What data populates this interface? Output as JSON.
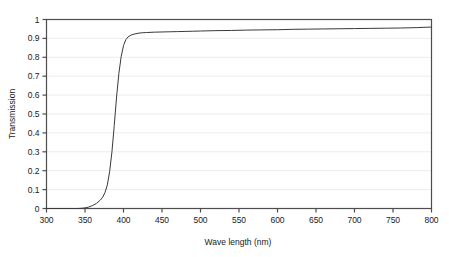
{
  "chart_data": {
    "type": "line",
    "title": "",
    "xlabel": "Wave length (nm)",
    "ylabel": "Transmission",
    "xlim": [
      300,
      800
    ],
    "ylim": [
      0,
      1
    ],
    "grid": true,
    "legend": "none",
    "xticks": [
      "300",
      "350",
      "400",
      "450",
      "500",
      "550",
      "600",
      "650",
      "700",
      "750",
      "800"
    ],
    "xtick_values": [
      300,
      350,
      400,
      450,
      500,
      550,
      600,
      650,
      700,
      750,
      800
    ],
    "yticks": [
      "0",
      "0.1",
      "0.2",
      "0.3",
      "0.4",
      "0.5",
      "0.6",
      "0.7",
      "0.8",
      "0.9",
      "1"
    ],
    "ytick_values": [
      0,
      0.1,
      0.2,
      0.3,
      0.4,
      0.5,
      0.6,
      0.7,
      0.8,
      0.9,
      1
    ],
    "series": [
      {
        "name": "Transmission",
        "color": "#3a3a3a",
        "x": [
          300,
          310,
          320,
          330,
          340,
          345,
          350,
          355,
          360,
          365,
          370,
          373,
          376,
          379,
          382,
          385,
          388,
          391,
          394,
          397,
          400,
          403,
          406,
          410,
          415,
          420,
          425,
          430,
          440,
          450,
          460,
          470,
          480,
          490,
          500,
          520,
          540,
          560,
          580,
          600,
          620,
          640,
          660,
          680,
          700,
          720,
          740,
          760,
          780,
          800
        ],
        "y": [
          0.0,
          0.0,
          0.0,
          0.0,
          0.0,
          0.001,
          0.003,
          0.008,
          0.016,
          0.027,
          0.045,
          0.06,
          0.085,
          0.125,
          0.195,
          0.3,
          0.44,
          0.59,
          0.715,
          0.805,
          0.862,
          0.893,
          0.908,
          0.918,
          0.924,
          0.928,
          0.93,
          0.931,
          0.933,
          0.934,
          0.935,
          0.936,
          0.937,
          0.938,
          0.939,
          0.941,
          0.942,
          0.944,
          0.945,
          0.946,
          0.948,
          0.949,
          0.95,
          0.951,
          0.952,
          0.953,
          0.954,
          0.955,
          0.957,
          0.96
        ]
      }
    ]
  },
  "axes": {
    "x_title": "Wave length (nm)",
    "y_title": "Transmission"
  },
  "colors": {
    "line": "#3a3a3a",
    "axis": "#4d4d4d",
    "grid": "#ececec",
    "text": "#1a1a1a",
    "background": "#ffffff"
  }
}
